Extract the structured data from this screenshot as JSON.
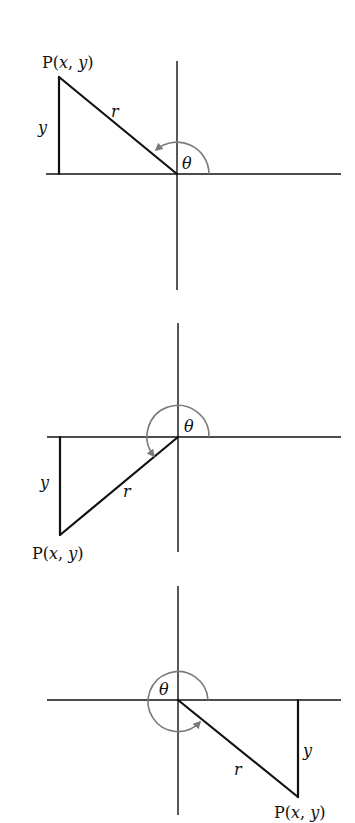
{
  "diagrams": [
    {
      "quadrant": "II",
      "point_label": "P(x, y)",
      "side_label": "y",
      "hyp_label": "r",
      "angle_label": "θ"
    },
    {
      "quadrant": "III",
      "point_label": "P(x, y)",
      "side_label": "y",
      "hyp_label": "r",
      "angle_label": "θ"
    },
    {
      "quadrant": "IV",
      "point_label": "P(x, y)",
      "side_label": "y",
      "hyp_label": "r",
      "angle_label": "θ"
    }
  ],
  "colors": {
    "line": "#111111",
    "arc": "#7a7a7a",
    "background": "#ffffff"
  }
}
